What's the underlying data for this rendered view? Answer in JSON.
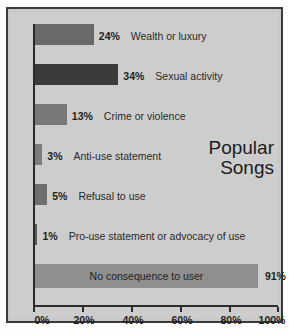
{
  "chart_data": {
    "type": "bar",
    "orientation": "horizontal",
    "title": "Popular Songs",
    "title_lines": [
      "Popular",
      "Songs"
    ],
    "xlabel": "",
    "ylabel": "",
    "xlim": [
      0,
      100
    ],
    "grid": false,
    "legend": false,
    "xticks": [
      "0%",
      "20%",
      "40%",
      "60%",
      "80%",
      "100%"
    ],
    "xtick_values": [
      0,
      20,
      40,
      60,
      80,
      100
    ],
    "categories": [
      "Wealth or luxury",
      "Sexual activity",
      "Crime or violence",
      "Anti-use statement",
      "Refusal to use",
      "Pro-use statement or advocacy of use",
      "No consequence to user"
    ],
    "values": [
      24,
      34,
      13,
      3,
      5,
      1,
      91
    ],
    "value_labels": [
      "24%",
      "34%",
      "13%",
      "3%",
      "5%",
      "1%",
      "91%"
    ],
    "bar_colors": [
      "#6a6a6a",
      "#3b3b3b",
      "#787878",
      "#7d7d7d",
      "#6f6f6f",
      "#5a5a5a",
      "#8f8f8f"
    ],
    "bars": [
      {
        "label": "Wealth or luxury",
        "value": 24,
        "value_label": "24%",
        "color": "#6a6a6a",
        "label_inside": false
      },
      {
        "label": "Sexual activity",
        "value": 34,
        "value_label": "34%",
        "color": "#3b3b3b",
        "label_inside": false
      },
      {
        "label": "Crime or violence",
        "value": 13,
        "value_label": "13%",
        "color": "#787878",
        "label_inside": false
      },
      {
        "label": "Anti-use statement",
        "value": 3,
        "value_label": "3%",
        "color": "#7d7d7d",
        "label_inside": false
      },
      {
        "label": "Refusal to use",
        "value": 5,
        "value_label": "5%",
        "color": "#6f6f6f",
        "label_inside": false
      },
      {
        "label": "Pro-use statement or advocacy of use",
        "value": 1,
        "value_label": "1%",
        "color": "#5a5a5a",
        "label_inside": false
      },
      {
        "label": "No consequence to user",
        "value": 91,
        "value_label": "91%",
        "color": "#8f8f8f",
        "label_inside": true
      }
    ]
  },
  "colors": {
    "figure_background": "#cdcdcd",
    "frame_border": "#3a3a3a",
    "axis": "#2b2b2b",
    "text": "#1f1f1f"
  }
}
